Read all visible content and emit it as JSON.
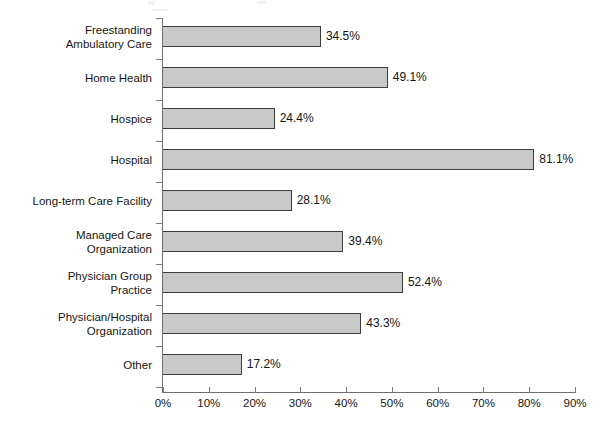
{
  "chart_data": {
    "type": "bar",
    "orientation": "horizontal",
    "title": "",
    "subtitle": "",
    "xlabel": "",
    "ylabel": "",
    "grid": false,
    "legend": false,
    "xlim": [
      0,
      90
    ],
    "xtick_labels": [
      "0%",
      "10%",
      "20%",
      "30%",
      "40%",
      "50%",
      "60%",
      "70%",
      "80%",
      "90%"
    ],
    "xticks": [
      0,
      10,
      20,
      30,
      40,
      50,
      60,
      70,
      80,
      90
    ],
    "categories": [
      "Freestanding\nAmbulatory Care",
      "Home Health",
      "Hospice",
      "Hospital",
      "Long-term Care Facility",
      "Managed Care\nOrganization",
      "Physician Group\nPractice",
      "Physician/Hospital\nOrganization",
      "Other"
    ],
    "values": [
      34.5,
      49.1,
      24.4,
      81.1,
      28.1,
      39.4,
      52.4,
      43.3,
      17.2
    ],
    "value_labels": [
      "34.5%",
      "49.1%",
      "24.4%",
      "81.1%",
      "28.1%",
      "39.4%",
      "52.4%",
      "43.3%",
      "17.2%"
    ],
    "bar_fill_color": "#c9c9c9",
    "bar_border_color": "#3d3d3d",
    "axis_color": "#6e6e6e"
  }
}
